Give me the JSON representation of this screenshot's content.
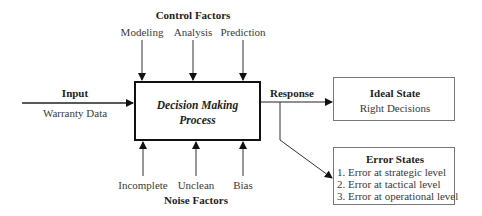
{
  "control": {
    "title": "Control Factors",
    "items": [
      "Modeling",
      "Analysis",
      "Prediction"
    ]
  },
  "input": {
    "title": "Input",
    "subtitle": "Warranty Data"
  },
  "process": {
    "line1": "Decision Making",
    "line2": "Process"
  },
  "response": {
    "label": "Response"
  },
  "ideal": {
    "title": "Ideal State",
    "subtitle": "Right Decisions"
  },
  "error": {
    "title": "Error States",
    "items": [
      "1. Error at strategic level",
      "2. Error at tactical level",
      "3. Error at operational level"
    ]
  },
  "noise": {
    "title": "Noise Factors",
    "items": [
      "Incomplete",
      "Unclean",
      "Bias"
    ]
  },
  "colors": {
    "line": "#222222",
    "box_border": "#777777"
  }
}
